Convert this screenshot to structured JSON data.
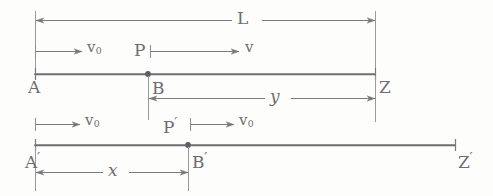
{
  "diagram": {
    "ink_color": "#6d6d70",
    "line_color": "#757578",
    "background_color": "#fdfdfc",
    "width": 493,
    "height": 196
  },
  "frames": [
    {
      "name": "upper-frame",
      "rod_label_left": "A",
      "rod_label_right": "Z",
      "point_label": "B",
      "moving_point_label": "P"
    },
    {
      "name": "lower-frame",
      "rod_label_left": "A′",
      "rod_label_right": "Z′",
      "point_label": "B′",
      "moving_point_label": "P′"
    }
  ],
  "labels": {
    "length_L": "L",
    "length_y": "y",
    "length_x": "x",
    "velocity_v0_upper": "v",
    "velocity_v0_upper_sub": "0",
    "velocity_v_upper": "v",
    "velocity_v0_lower_left": "v",
    "velocity_v0_lower_left_sub": "0",
    "velocity_v0_lower_right": "v",
    "velocity_v0_lower_right_sub": "0",
    "point_A": "A",
    "point_B": "B",
    "point_Z": "Z",
    "point_P": "P",
    "point_A_prime": "A",
    "point_B_prime": "B",
    "point_Z_prime": "Z",
    "point_P_prime": "P",
    "prime_mark": "′"
  },
  "geometry": {
    "upper_rod_y": 74,
    "lower_rod_y": 145,
    "upper_rod_x1": 35,
    "upper_rod_x2": 375,
    "lower_rod_x1": 35,
    "lower_rod_x2": 455,
    "upper_point_x": 148,
    "lower_point_x": 188,
    "dim_L_y": 20,
    "dim_y_y": 98,
    "dim_x_y": 172
  }
}
